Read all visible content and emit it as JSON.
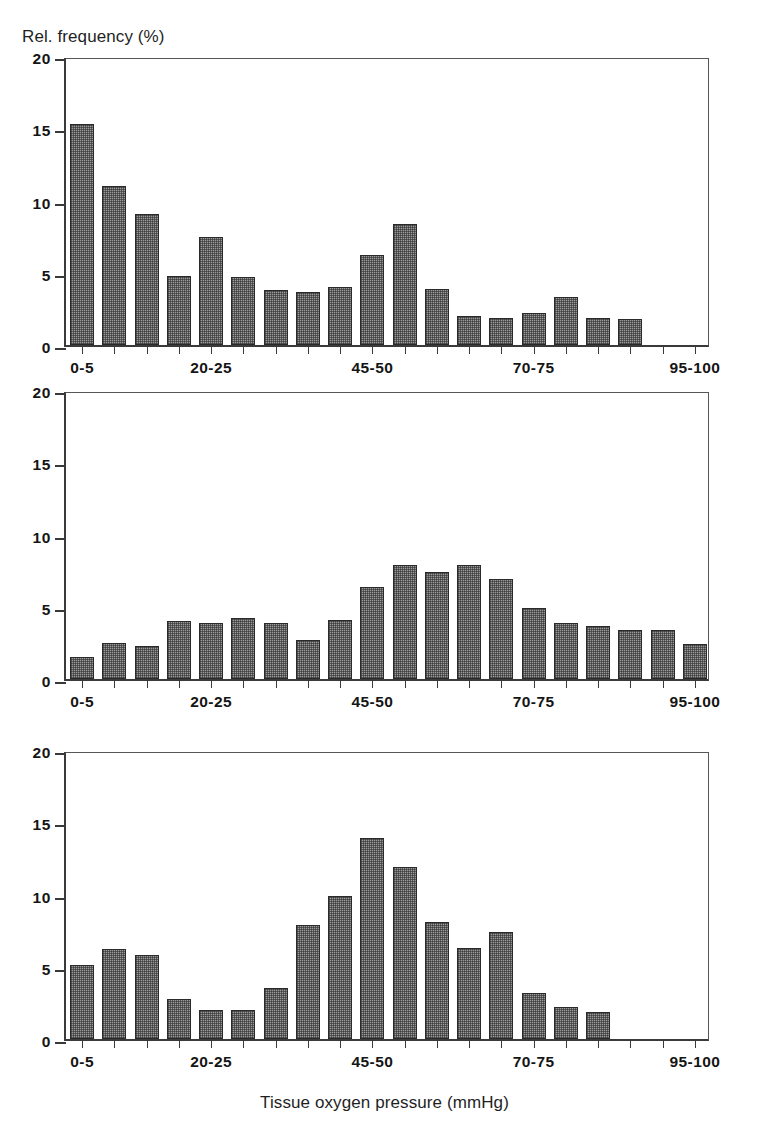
{
  "figure": {
    "y_axis_label": "Rel. frequency (%)",
    "x_axis_label": "Tissue oxygen pressure (mmHg)",
    "y_ticks": [
      "0",
      "5",
      "10",
      "15",
      "20"
    ],
    "x_tick_labels": [
      "0-5",
      "20-25",
      "45-50",
      "70-75",
      "95-100"
    ],
    "bar_fill_color": "#9a9a9a",
    "bar_border_color": "#2a2a2a",
    "axis_color": "#3a3a3a"
  },
  "panels": [
    {
      "id": "a",
      "title": "a) Breast cancer",
      "subtitle": "N=18, n=1018"
    },
    {
      "id": "b",
      "title": "b) Normal breast",
      "subtitle": "N=26, n=1443"
    },
    {
      "id": "c",
      "title": "C) Benign breast tumors",
      "subtitle": "N=9. n=452"
    }
  ],
  "chart_data": [
    {
      "type": "bar",
      "title": "a) Breast cancer",
      "subtitle": "N=18, n=1018",
      "xlabel": "Tissue oxygen pressure (mmHg)",
      "ylabel": "Rel. frequency (%)",
      "ylim": [
        0,
        20
      ],
      "yticks": [
        0,
        5,
        10,
        15,
        20
      ],
      "grid": false,
      "legend": "none",
      "categories": [
        "0-5",
        "5-10",
        "10-15",
        "15-20",
        "20-25",
        "25-30",
        "30-35",
        "35-40",
        "40-45",
        "45-50",
        "50-55",
        "55-60",
        "60-65",
        "65-70",
        "70-75",
        "75-80",
        "80-85",
        "85-90",
        "90-95",
        "95-100"
      ],
      "xtick_labels": [
        "0-5",
        "20-25",
        "45-50",
        "70-75",
        "95-100"
      ],
      "values": [
        15.3,
        11.0,
        9.1,
        4.8,
        7.5,
        4.7,
        3.8,
        3.7,
        4.0,
        6.2,
        8.4,
        3.9,
        2.0,
        1.9,
        2.2,
        3.3,
        1.9,
        1.8,
        0,
        0
      ]
    },
    {
      "type": "bar",
      "title": "b) Normal breast",
      "subtitle": "N=26, n=1443",
      "xlabel": "Tissue oxygen pressure (mmHg)",
      "ylabel": "Rel. frequency (%)",
      "ylim": [
        0,
        20
      ],
      "yticks": [
        0,
        5,
        10,
        15,
        20
      ],
      "grid": false,
      "legend": "none",
      "categories": [
        "0-5",
        "5-10",
        "10-15",
        "15-20",
        "20-25",
        "25-30",
        "30-35",
        "35-40",
        "40-45",
        "45-50",
        "50-55",
        "55-60",
        "60-65",
        "65-70",
        "70-75",
        "75-80",
        "80-85",
        "85-90",
        "90-95",
        "95-100"
      ],
      "xtick_labels": [
        "0-5",
        "20-25",
        "45-50",
        "70-75",
        "95-100"
      ],
      "values": [
        1.5,
        2.5,
        2.3,
        4.0,
        3.9,
        4.2,
        3.9,
        2.7,
        4.1,
        6.4,
        7.9,
        7.4,
        7.9,
        6.9,
        4.9,
        3.9,
        3.7,
        3.4,
        3.4,
        2.4
      ]
    },
    {
      "type": "bar",
      "title": "C) Benign breast tumors",
      "subtitle": "N=9. n=452",
      "xlabel": "Tissue oxygen pressure (mmHg)",
      "ylabel": "Rel. frequency (%)",
      "ylim": [
        0,
        20
      ],
      "yticks": [
        0,
        5,
        10,
        15,
        20
      ],
      "grid": false,
      "legend": "none",
      "categories": [
        "0-5",
        "5-10",
        "10-15",
        "15-20",
        "20-25",
        "25-30",
        "30-35",
        "35-40",
        "40-45",
        "45-50",
        "50-55",
        "55-60",
        "60-65",
        "65-70",
        "70-75",
        "75-80",
        "80-85",
        "85-90",
        "90-95",
        "95-100"
      ],
      "xtick_labels": [
        "0-5",
        "20-25",
        "45-50",
        "70-75",
        "95-100"
      ],
      "values": [
        5.1,
        6.2,
        5.8,
        2.8,
        2.0,
        2.0,
        3.5,
        7.9,
        9.9,
        13.9,
        11.9,
        8.1,
        6.3,
        7.4,
        3.2,
        2.2,
        1.9,
        0,
        0,
        0
      ]
    }
  ]
}
